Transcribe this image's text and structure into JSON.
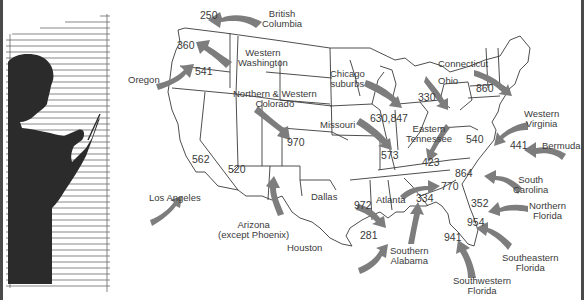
{
  "map": {
    "title": "",
    "arrow_color": "#7d7d7d",
    "border_color": "#3a3a3a",
    "regions": [
      {
        "name": "British Columbia",
        "line1": "British",
        "line2": "Columbia",
        "code": "250"
      },
      {
        "name": "Western Washington",
        "line1": "Western",
        "line2": "Washington",
        "code": "360"
      },
      {
        "name": "Oregon",
        "line1": "Oregon",
        "line2": "",
        "code": "541"
      },
      {
        "name": "Northern & Western Colorado",
        "line1": "Northern & Western",
        "line2": "Colorado",
        "code": "970"
      },
      {
        "name": "Chicago suburbs",
        "line1": "Chicago",
        "line2": "suburbs",
        "code": "630,847"
      },
      {
        "name": "Missouri",
        "line1": "Missouri",
        "line2": "",
        "code": "573"
      },
      {
        "name": "Ohio",
        "line1": "Ohio",
        "line2": "",
        "code": "330"
      },
      {
        "name": "Connecticut",
        "line1": "Connecticut",
        "line2": "",
        "code": "860"
      },
      {
        "name": "Eastern Tennessee",
        "line1": "Eastern",
        "line2": "Tennessee",
        "code": "423"
      },
      {
        "name": "Western Virginia",
        "line1": "Western",
        "line2": "Virginia",
        "code": "540"
      },
      {
        "name": "Bermuda",
        "line1": "Bermuda",
        "line2": "",
        "code": "441"
      },
      {
        "name": "South Carolina",
        "line1": "South",
        "line2": "Carolina",
        "code": "864"
      },
      {
        "name": "Northern Florida",
        "line1": "Northern",
        "line2": "Florida",
        "code": "352"
      },
      {
        "name": "Southeastern Florida",
        "line1": "Southeastern",
        "line2": "Florida",
        "code": "954"
      },
      {
        "name": "Southwestern Florida",
        "line1": "Southwestern",
        "line2": "Florida",
        "code": "941"
      },
      {
        "name": "Southern Alabama",
        "line1": "Southern",
        "line2": "Alabama",
        "code": "334"
      },
      {
        "name": "Atlanta",
        "line1": "Atlanta",
        "line2": "",
        "code": "770"
      },
      {
        "name": "Dallas",
        "line1": "Dallas",
        "line2": "",
        "code": "972"
      },
      {
        "name": "Houston",
        "line1": "Houston",
        "line2": "",
        "code": "281"
      },
      {
        "name": "Arizona (except Phoenix)",
        "line1": "Arizona",
        "line2": "(except Phoenix)",
        "code": "520"
      },
      {
        "name": "Los Angeles",
        "line1": "Los Angeles",
        "line2": "",
        "code": "562"
      }
    ]
  }
}
